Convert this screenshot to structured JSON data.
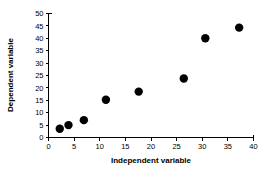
{
  "chart_data": {
    "type": "scatter",
    "title": "",
    "xlabel": "Independent variable",
    "ylabel": "Dependent variable",
    "xlim": [
      0,
      40
    ],
    "ylim": [
      0,
      50
    ],
    "grid": false,
    "legend": null,
    "marker": {
      "shape": "circle",
      "color": "#000000",
      "size": 4.2
    },
    "xticks": [
      "0",
      "5",
      "10",
      "15",
      "20",
      "25",
      "30",
      "35",
      "40"
    ],
    "yticks": [
      "0",
      "5",
      "10",
      "15",
      "20",
      "25",
      "30",
      "35",
      "40",
      "45",
      "50"
    ],
    "xtick_values": [
      0,
      5,
      10,
      15,
      20,
      25,
      30,
      35,
      40
    ],
    "ytick_values": [
      0,
      5,
      10,
      15,
      20,
      25,
      30,
      35,
      40,
      45,
      50
    ],
    "points": [
      {
        "x": 2.2,
        "y": 3.5
      },
      {
        "x": 3.9,
        "y": 5.0
      },
      {
        "x": 6.9,
        "y": 7.0
      },
      {
        "x": 11.2,
        "y": 15.2
      },
      {
        "x": 17.6,
        "y": 18.5
      },
      {
        "x": 26.4,
        "y": 23.8
      },
      {
        "x": 30.6,
        "y": 40.0
      },
      {
        "x": 37.2,
        "y": 44.3
      }
    ],
    "x": [
      2.2,
      3.9,
      6.9,
      11.2,
      17.6,
      26.4,
      30.6,
      37.2
    ],
    "values": [
      3.5,
      5.0,
      7.0,
      15.2,
      18.5,
      23.8,
      40.0,
      44.3
    ]
  },
  "colors": {
    "axis": "#000000",
    "marker": "#000000",
    "background": "#ffffff"
  }
}
